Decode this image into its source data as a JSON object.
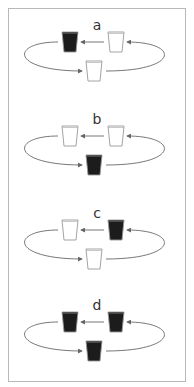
{
  "figure": {
    "border_color": "#b8b8b8",
    "cup_full_color": "#1c1c1c",
    "cup_empty_color": "#ffffff",
    "cup_outline_color": "#999999",
    "arrow_color": "#777777",
    "panels": [
      {
        "label": "a",
        "cups": {
          "left": "full",
          "right": "empty",
          "bottom": "empty"
        }
      },
      {
        "label": "b",
        "cups": {
          "left": "empty",
          "right": "empty",
          "bottom": "full"
        }
      },
      {
        "label": "c",
        "cups": {
          "left": "empty",
          "right": "full",
          "bottom": "empty"
        }
      },
      {
        "label": "d",
        "cups": {
          "left": "full",
          "right": "full",
          "bottom": "full"
        }
      }
    ],
    "arrows": [
      "right-cup-to-left-cup",
      "left-cup-to-bottom-cup (looping around left)",
      "bottom-cup-to-right-cup (looping around right)"
    ]
  }
}
